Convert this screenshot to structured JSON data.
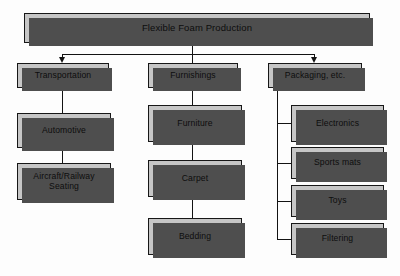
{
  "diagram": {
    "title": "Flexible Foam Production",
    "type": "tree-flowchart",
    "colors": {
      "node_fill": "#c6c6c6",
      "node_border": "#171717",
      "node_shadow": "#4e4e4e",
      "connector": "#131313",
      "background": "#fdfdfd",
      "text": "#0d0d0d"
    },
    "root": {
      "label": "Flexible Foam Production"
    },
    "branches": [
      {
        "label": "Transportation",
        "children": [
          {
            "label": "Automotive"
          },
          {
            "label": "Aircraft/Railway Seating",
            "line1": "Aircraft/Railway",
            "line2": "Seating"
          }
        ]
      },
      {
        "label": "Furnishings",
        "children": [
          {
            "label": "Furniture"
          },
          {
            "label": "Carpet"
          },
          {
            "label": "Bedding"
          }
        ]
      },
      {
        "label": "Packaging, etc.",
        "children": [
          {
            "label": "Electronics"
          },
          {
            "label": "Sports mats"
          },
          {
            "label": "Toys"
          },
          {
            "label": "Filtering"
          }
        ]
      }
    ]
  }
}
